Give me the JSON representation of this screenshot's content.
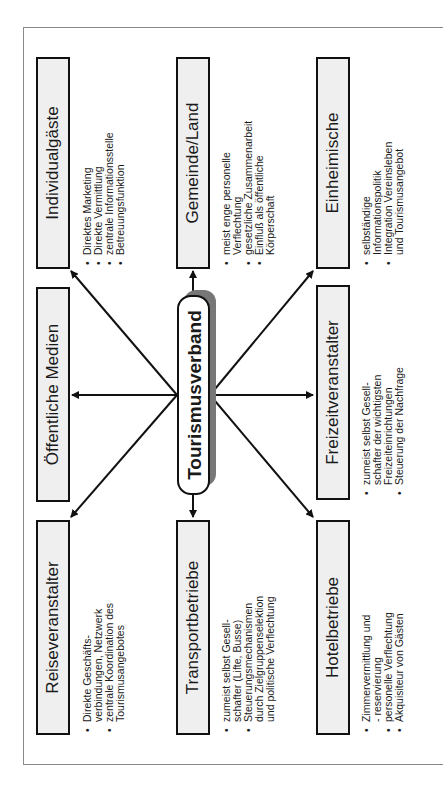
{
  "center": {
    "label": "Tourismusverband"
  },
  "nodes": [
    {
      "id": "individualgaeste",
      "title": "Individualgäste",
      "bullets": [
        "Direktes Marketing",
        "Direkte Vermittlung",
        "zentrale Informationsstelle",
        "Betreuungsfunktion"
      ]
    },
    {
      "id": "oeffentliche-medien",
      "title": "Öffentliche Medien",
      "bullets": []
    },
    {
      "id": "reiseveranstalter",
      "title": "Reiseveranstalter",
      "bullets": [
        "Direkte Geschäfts-",
        "verbindungen, Netzwerk",
        "zentrale Koordination des",
        "Tourismusangebotes"
      ]
    },
    {
      "id": "gemeinde-land",
      "title": "Gemeinde/Land",
      "bullets": [
        "meist enge personelle",
        "Verflechtung",
        "gesetzliche Zusammenarbeit",
        "Einfluß als öffentliche",
        "Körperschaft"
      ]
    },
    {
      "id": "transportbetriebe",
      "title": "Transportbetriebe",
      "bullets": [
        "zumeist selbst Gesell-",
        "schafter (Lifte, Busse)",
        "Steuerungsmechanismen",
        "durch Zielgruppenselektion",
        "und politische Verflechtung"
      ]
    },
    {
      "id": "einheimische",
      "title": "Einheimische",
      "bullets": [
        "selbständige",
        "Informationspolitik",
        "Integration Vereinsleben",
        "und Tourismusangebot"
      ]
    },
    {
      "id": "freizeitveranstalter",
      "title": "Freizeitveranstalter",
      "bullets": [
        "zumeist selbst Gesell-",
        "schafter der wichtigsten",
        "Freizeiteinrichtungen",
        "Steuerung der Nachfrage"
      ]
    },
    {
      "id": "hotelbetriebe",
      "title": "Hotelbetriebe",
      "bullets": [
        "Zimmervermittlung und",
        "- reservierung",
        "personelle Verflechtung",
        "Akquisiteur von Gästen"
      ]
    }
  ],
  "colors": {
    "box_fill": "#efefef",
    "border": "#111111",
    "shadow": "#777777",
    "frame": "#8a8a8a"
  }
}
